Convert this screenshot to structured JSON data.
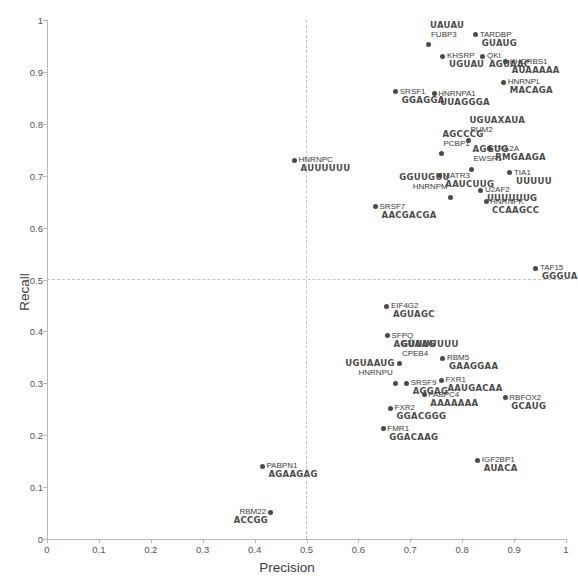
{
  "chart_data": {
    "type": "scatter",
    "title": "",
    "xlabel": "Precision",
    "ylabel": "Recall",
    "xlim": [
      0,
      1
    ],
    "ylim": [
      0,
      1
    ],
    "xticks": [
      "0",
      "0.1",
      "0.2",
      "0.3",
      "0.4",
      "0.5",
      "0.6",
      "0.7",
      "0.8",
      "0.9",
      "1"
    ],
    "yticks": [
      "0",
      "0.1",
      "0.2",
      "0.3",
      "0.4",
      "0.5",
      "0.6",
      "0.7",
      "0.8",
      "0.9",
      "1"
    ],
    "grid": false,
    "reference_lines": [
      {
        "axis": "x",
        "value": 0.5,
        "style": "dashed"
      },
      {
        "axis": "y",
        "value": 0.5,
        "style": "dashed"
      }
    ],
    "point_color": "#4a4a4a",
    "legend": "none",
    "points": [
      {
        "label": "FUBP3",
        "motif": "UAUAU",
        "x": 0.736,
        "y": 0.952,
        "lpos": "above",
        "anchor": "left"
      },
      {
        "label": "TARDBP",
        "motif": "GUAUG",
        "x": 0.826,
        "y": 0.972,
        "lpos": "right",
        "anchor": "left"
      },
      {
        "label": "KHSRP",
        "motif": "UGUAU",
        "x": 0.763,
        "y": 0.93,
        "lpos": "right",
        "anchor": "left"
      },
      {
        "label": "QKI",
        "motif": "AGUAAC",
        "x": 0.84,
        "y": 0.93,
        "lpos": "right",
        "anchor": "left"
      },
      {
        "label": "KHDRBS1",
        "motif": "AUAAAAA",
        "x": 0.884,
        "y": 0.92,
        "lpos": "right",
        "anchor": "left"
      },
      {
        "label": "HNRNPL",
        "motif": "MACAGA",
        "x": 0.88,
        "y": 0.88,
        "lpos": "right",
        "anchor": "left"
      },
      {
        "label": "SRSF1",
        "motif": "GGAGGA",
        "x": 0.672,
        "y": 0.862,
        "lpos": "right",
        "anchor": "left"
      },
      {
        "label": "HNRNPA1",
        "motif": "UUAGGGA",
        "x": 0.746,
        "y": 0.858,
        "lpos": "right",
        "anchor": "left"
      },
      {
        "label": "PUM2",
        "motif": "UGUAXAUA",
        "x": 0.812,
        "y": 0.768,
        "lpos": "above",
        "anchor": "left"
      },
      {
        "label": "TRA2A",
        "motif": "RMGAAGA",
        "x": 0.852,
        "y": 0.752,
        "lpos": "right",
        "anchor": "left"
      },
      {
        "label": "PCBP1",
        "motif": "AGCCCG",
        "x": 0.76,
        "y": 0.742,
        "lpos": "above",
        "anchor": "left"
      },
      {
        "label": "HNRNPC",
        "motif": "AUUUUUU",
        "x": 0.477,
        "y": 0.73,
        "lpos": "right",
        "anchor": "left"
      },
      {
        "label": "EWSR1",
        "motif": "AGGUG",
        "x": 0.818,
        "y": 0.712,
        "lpos": "above",
        "anchor": "left"
      },
      {
        "label": "TIA1",
        "motif": "UUUUU",
        "x": 0.892,
        "y": 0.706,
        "lpos": "right",
        "anchor": "left"
      },
      {
        "label": "MATR3",
        "motif": "AAUCUUG",
        "x": 0.756,
        "y": 0.7,
        "lpos": "right",
        "anchor": "left"
      },
      {
        "label": "U2AF2",
        "motif": "UUUUUUG",
        "x": 0.836,
        "y": 0.672,
        "lpos": "right",
        "anchor": "left"
      },
      {
        "label": "HNRNPM",
        "motif": "GGUUGUU",
        "x": 0.778,
        "y": 0.658,
        "lpos": "above",
        "anchor": "right"
      },
      {
        "label": "HNRNPK",
        "motif": "CCAAGCC",
        "x": 0.846,
        "y": 0.65,
        "lpos": "right",
        "anchor": "left"
      },
      {
        "label": "SRSF7",
        "motif": "AACGACGA",
        "x": 0.633,
        "y": 0.64,
        "lpos": "right",
        "anchor": "left"
      },
      {
        "label": "TAF15",
        "motif": "GGGUA",
        "x": 0.942,
        "y": 0.522,
        "lpos": "right",
        "anchor": "left"
      },
      {
        "label": "EIF4G2",
        "motif": "AGUAGC",
        "x": 0.655,
        "y": 0.448,
        "lpos": "right",
        "anchor": "left"
      },
      {
        "label": "SFPQ",
        "motif": "AGUAAG",
        "x": 0.656,
        "y": 0.392,
        "lpos": "right",
        "anchor": "left"
      },
      {
        "label": "RBM5",
        "motif": "GAAGGAA",
        "x": 0.763,
        "y": 0.348,
        "lpos": "right",
        "anchor": "left"
      },
      {
        "label": "CPEB4",
        "motif": "GUUUUUUU",
        "x": 0.68,
        "y": 0.338,
        "lpos": "above",
        "anchor": "left"
      },
      {
        "label": "FXR1",
        "motif": "AAUGACAA",
        "x": 0.76,
        "y": 0.306,
        "lpos": "right",
        "anchor": "left"
      },
      {
        "label": "SRSF9",
        "motif": "AGGAG",
        "x": 0.693,
        "y": 0.3,
        "lpos": "right",
        "anchor": "left"
      },
      {
        "label": "HNRNPU",
        "motif": "UGUAAUG",
        "x": 0.672,
        "y": 0.3,
        "lpos": "above",
        "anchor": "right"
      },
      {
        "label": "PABPC4",
        "motif": "AAAAAAA",
        "x": 0.727,
        "y": 0.278,
        "lpos": "right",
        "anchor": "left"
      },
      {
        "label": "RBFOX2",
        "motif": "GCAUG",
        "x": 0.883,
        "y": 0.272,
        "lpos": "right",
        "anchor": "left"
      },
      {
        "label": "FXR2",
        "motif": "GGACGGG",
        "x": 0.662,
        "y": 0.252,
        "lpos": "right",
        "anchor": "left"
      },
      {
        "label": "FMR1",
        "motif": "GGACAAG",
        "x": 0.648,
        "y": 0.212,
        "lpos": "right",
        "anchor": "left"
      },
      {
        "label": "IGF2BP1",
        "motif": "AUACA",
        "x": 0.83,
        "y": 0.152,
        "lpos": "right",
        "anchor": "left"
      },
      {
        "label": "PABPN1",
        "motif": "AGAAGAG",
        "x": 0.415,
        "y": 0.14,
        "lpos": "right",
        "anchor": "left"
      },
      {
        "label": "RBM22",
        "motif": "ACCGG",
        "x": 0.43,
        "y": 0.052,
        "lpos": "left",
        "anchor": "right"
      }
    ]
  }
}
